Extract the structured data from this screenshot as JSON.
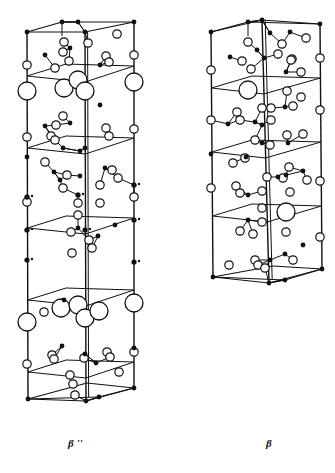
{
  "figure": {
    "structures": [
      {
        "id": "beta-double-prime",
        "label": "β ''",
        "frame": {
          "tl": [
            27,
            32
          ],
          "tb": [
            62,
            22
          ],
          "tm": [
            85,
            32
          ],
          "tr": [
            134,
            22
          ],
          "bl": [
            28,
            399
          ],
          "bm": [
            86,
            401
          ],
          "bf": [
            99,
            397
          ],
          "br": [
            134,
            388
          ]
        },
        "planes_y": [
          76,
          148,
          228,
          300,
          372
        ],
        "large_atoms": [
          [
            27,
            91
          ],
          [
            64,
            88
          ],
          [
            78,
            80
          ],
          [
            85,
            91
          ],
          [
            134,
            82
          ],
          [
            27,
            322
          ],
          [
            61,
            308
          ],
          [
            78,
            305
          ],
          [
            85,
            318
          ],
          [
            99,
            311
          ],
          [
            134,
            303
          ]
        ],
        "open_atoms": [
          [
            27,
            65
          ],
          [
            134,
            55
          ],
          [
            27,
            137
          ],
          [
            134,
            129
          ],
          [
            27,
            202
          ],
          [
            134,
            197
          ],
          [
            27,
            364
          ],
          [
            134,
            352
          ],
          [
            64,
            42
          ],
          [
            88,
            43
          ],
          [
            117,
            34
          ],
          [
            55,
            68
          ],
          [
            63,
            52
          ],
          [
            69,
            61
          ],
          [
            106,
            56
          ],
          [
            109,
            62
          ],
          [
            56,
            125
          ],
          [
            51,
            136
          ],
          [
            55,
            140
          ],
          [
            106,
            128
          ],
          [
            109,
            136
          ],
          [
            63,
            116
          ],
          [
            67,
            175
          ],
          [
            63,
            188
          ],
          [
            100,
            185
          ],
          [
            112,
            170
          ],
          [
            118,
            178
          ],
          [
            45,
            162
          ],
          [
            78,
            203
          ],
          [
            100,
            203
          ],
          [
            78,
            215
          ],
          [
            71,
            232
          ],
          [
            72,
            253
          ],
          [
            89,
            240
          ],
          [
            92,
            248
          ],
          [
            44,
            312
          ],
          [
            52,
            355
          ],
          [
            54,
            359
          ],
          [
            107,
            352
          ],
          [
            110,
            357
          ],
          [
            84,
            358
          ],
          [
            70,
            375
          ],
          [
            73,
            384
          ],
          [
            75,
            395
          ],
          [
            119,
            372
          ]
        ],
        "filled_atoms": [
          [
            27,
            32
          ],
          [
            62,
            22
          ],
          [
            78,
            22
          ],
          [
            134,
            22
          ],
          [
            85,
            32
          ],
          [
            45,
            55
          ],
          [
            70,
            48
          ],
          [
            100,
            65
          ],
          [
            70,
            123
          ],
          [
            45,
            126
          ],
          [
            100,
            105
          ],
          [
            63,
            148
          ],
          [
            85,
            148
          ],
          [
            27,
            157
          ],
          [
            80,
            176
          ],
          [
            80,
            151
          ],
          [
            105,
            168
          ],
          [
            54,
            172
          ],
          [
            60,
            180
          ],
          [
            27,
            197
          ],
          [
            78,
            195
          ],
          [
            134,
            185
          ],
          [
            27,
            230
          ],
          [
            78,
            228
          ],
          [
            98,
            236
          ],
          [
            115,
            225
          ],
          [
            64,
            300
          ],
          [
            62,
            346
          ],
          [
            85,
            354
          ],
          [
            96,
            363
          ],
          [
            134,
            348
          ],
          [
            28,
            399
          ],
          [
            86,
            401
          ],
          [
            99,
            397
          ],
          [
            134,
            388
          ]
        ]
      },
      {
        "id": "beta",
        "label": "β",
        "frame": {
          "tl": [
            211,
            32
          ],
          "tb": [
            248,
            22
          ],
          "tm": [
            262,
            20
          ],
          "tr": [
            320,
            24
          ],
          "bl": [
            213,
            277
          ],
          "bm": [
            269,
            283
          ],
          "bf": [
            285,
            280
          ],
          "br": [
            322,
            269
          ]
        },
        "planes_y": [
          88,
          152,
          216
        ],
        "large_atoms": [
          [
            248,
            90
          ],
          [
            286,
            212
          ]
        ],
        "open_atoms": [
          [
            211,
            70
          ],
          [
            320,
            58
          ],
          [
            211,
            120
          ],
          [
            320,
            110
          ],
          [
            211,
            188
          ],
          [
            320,
            181
          ],
          [
            248,
            42
          ],
          [
            242,
            61
          ],
          [
            251,
            69
          ],
          [
            282,
            44
          ],
          [
            278,
            54
          ],
          [
            292,
            59
          ],
          [
            301,
            72
          ],
          [
            306,
            38
          ],
          [
            291,
            60
          ],
          [
            287,
            91
          ],
          [
            301,
            97
          ],
          [
            293,
            106
          ],
          [
            237,
            112
          ],
          [
            240,
            120
          ],
          [
            262,
            108
          ],
          [
            271,
            108
          ],
          [
            271,
            120
          ],
          [
            255,
            140
          ],
          [
            233,
            163
          ],
          [
            245,
            158
          ],
          [
            287,
            135
          ],
          [
            303,
            134
          ],
          [
            270,
            145
          ],
          [
            289,
            167
          ],
          [
            267,
            177
          ],
          [
            307,
            180
          ],
          [
            283,
            178
          ],
          [
            290,
            192
          ],
          [
            236,
            186
          ],
          [
            240,
            193
          ],
          [
            262,
            191
          ],
          [
            262,
            208
          ],
          [
            262,
            222
          ],
          [
            286,
            232
          ],
          [
            240,
            231
          ],
          [
            253,
            234
          ],
          [
            255,
            260
          ],
          [
            258,
            265
          ],
          [
            265,
            268
          ],
          [
            229,
            265
          ],
          [
            293,
            260
          ],
          [
            320,
            237
          ]
        ],
        "filled_atoms": [
          [
            211,
            32
          ],
          [
            248,
            22
          ],
          [
            262,
            20
          ],
          [
            270,
            33
          ],
          [
            290,
            32
          ],
          [
            320,
            24
          ],
          [
            230,
            57
          ],
          [
            257,
            50
          ],
          [
            264,
            58
          ],
          [
            286,
            72
          ],
          [
            228,
            124
          ],
          [
            255,
            122
          ],
          [
            262,
            125
          ],
          [
            285,
            107
          ],
          [
            262,
            143
          ],
          [
            288,
            143
          ],
          [
            211,
            154
          ],
          [
            246,
            157
          ],
          [
            278,
            177
          ],
          [
            286,
            175
          ],
          [
            303,
            171
          ],
          [
            248,
            195
          ],
          [
            248,
            220
          ],
          [
            270,
            260
          ],
          [
            285,
            254
          ],
          [
            303,
            245
          ],
          [
            213,
            277
          ],
          [
            269,
            283
          ],
          [
            285,
            280
          ],
          [
            322,
            269
          ]
        ]
      }
    ]
  },
  "labels": {
    "left": "β ''",
    "right": "β"
  }
}
